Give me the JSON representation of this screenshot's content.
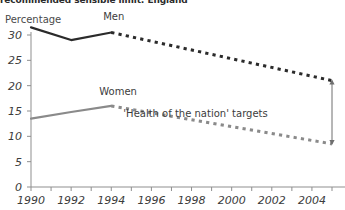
{
  "chart_data": {
    "type": "line",
    "title": "recommended sensible limit: England",
    "ylabel": "Percentage",
    "xlabel": "",
    "xlim": [
      1990,
      2005
    ],
    "ylim": [
      0,
      32
    ],
    "grid": false,
    "legend_position": "inline-labels",
    "yticks": [
      0,
      5,
      10,
      15,
      20,
      25,
      30
    ],
    "ytick_labels": [
      "0",
      "5",
      "10",
      "15",
      "20",
      "25",
      "30"
    ],
    "xticks": [
      1990,
      1991,
      1992,
      1993,
      1994,
      1995,
      1996,
      1997,
      1998,
      1999,
      2000,
      2001,
      2002,
      2003,
      2004,
      2005
    ],
    "xtick_labels": [
      "1990",
      "1992",
      "1994",
      "1996",
      "1998",
      "2000",
      "2002",
      "2004"
    ],
    "xtick_label_years": [
      1990,
      1992,
      1994,
      1996,
      1998,
      2000,
      2002,
      2004
    ],
    "series": [
      {
        "name": "Men",
        "color": "#2b2b2b",
        "style": "solid",
        "x": [
          1990,
          1992,
          1994
        ],
        "values": [
          31.5,
          29.0,
          30.5
        ]
      },
      {
        "name": "Men target",
        "color": "#2b2b2b",
        "style": "dotted",
        "x": [
          1994,
          2005
        ],
        "values": [
          30.5,
          21.0
        ]
      },
      {
        "name": "Women",
        "color": "#8a8a8a",
        "style": "solid",
        "x": [
          1990,
          1992,
          1994
        ],
        "values": [
          13.5,
          14.8,
          16.0
        ]
      },
      {
        "name": "Women target",
        "color": "#8a8a8a",
        "style": "dotted",
        "x": [
          1994,
          2005
        ],
        "values": [
          16.0,
          8.5
        ]
      }
    ],
    "annotations": [
      {
        "text": "'Health of the nation' targets",
        "x": 1998.2,
        "y": 14.2
      }
    ],
    "series_labels": [
      {
        "text": "Men",
        "x": 1993.6,
        "y": 33.3
      },
      {
        "text": "Women",
        "x": 1993.4,
        "y": 18.6
      }
    ],
    "target_range_marker": {
      "type": "double-headed-arrow",
      "x": 2005,
      "y_top": 21.0,
      "y_bottom": 8.5
    }
  },
  "colors": {
    "men": "#2b2b2b",
    "women": "#8a8a8a",
    "axis": "#8f8f8f",
    "text": "#3c3c3c",
    "background": "#ffffff"
  }
}
